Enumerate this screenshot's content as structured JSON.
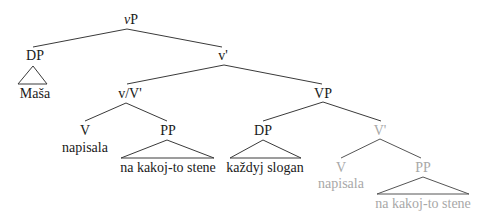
{
  "colors": {
    "ink": "#1a1a1a",
    "ghost": "#a8a8a8",
    "line": "#333333",
    "ghost_line": "#555555"
  },
  "nodes": {
    "vP": {
      "prefix": "v",
      "suffix": "P"
    },
    "dp_subject": "DP",
    "subject_word": "Maša",
    "v_bar": "v'",
    "vV_bar": "v/V'",
    "v_head": "V",
    "v_head_word": "napisala",
    "pp_high": "PP",
    "pp_high_words": "na kakoj-to stene",
    "VP": "VP",
    "dp_object": "DP",
    "object_words": "každyj slogan",
    "V_bar_ghost": "V'",
    "v_ghost": "V",
    "v_ghost_word": "napisala",
    "pp_ghost": "PP",
    "pp_ghost_words": "na kakoj-to stene"
  }
}
